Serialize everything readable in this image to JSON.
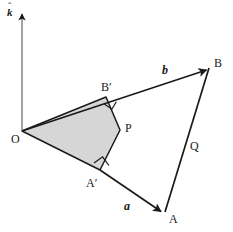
{
  "figure": {
    "background_color": "#ffffff",
    "stroke_color": "#1a1a1a",
    "shaded_region_fill": "#d6d6d6",
    "width": 233,
    "height": 232
  },
  "axis": {
    "name": "k-hat",
    "label": "k",
    "hat": "ˆ",
    "orientation": "vertical",
    "arrow_direction": "up"
  },
  "points": [
    {
      "id": "O",
      "label": "O",
      "x": 22,
      "y": 131
    },
    {
      "id": "A",
      "label": "A",
      "x": 163,
      "y": 214
    },
    {
      "id": "B",
      "label": "B",
      "x": 209,
      "y": 68
    },
    {
      "id": "Ap",
      "label": "A′",
      "x": 100,
      "y": 170
    },
    {
      "id": "Bp",
      "label": "B′",
      "x": 106,
      "y": 97
    },
    {
      "id": "P",
      "label": "P",
      "x": 120,
      "y": 130
    }
  ],
  "vectors": [
    {
      "id": "a",
      "label": "a",
      "from": "A′",
      "to": "A",
      "arrow": true
    },
    {
      "id": "b",
      "label": "b",
      "from": "O",
      "to": "B",
      "arrow": true
    }
  ],
  "segments": [
    {
      "id": "Q",
      "label": "Q",
      "from": "B",
      "to": "A",
      "arrow": false
    }
  ],
  "right_angles": [
    {
      "id": "right-angle-bprime",
      "at": "B′"
    },
    {
      "id": "right-angle-aprime",
      "at": "A′"
    }
  ],
  "shaded_region": {
    "id": "quadrilateral-OBPA",
    "vertices": [
      "O",
      "B′",
      "P",
      "A′"
    ]
  }
}
